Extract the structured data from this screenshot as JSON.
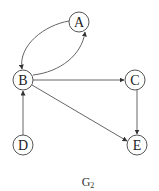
{
  "graph": {
    "caption": "G",
    "caption_subscript": "2",
    "nodes": [
      {
        "id": "A",
        "label": "A",
        "x": 79,
        "y": 22
      },
      {
        "id": "B",
        "label": "B",
        "x": 23,
        "y": 80
      },
      {
        "id": "C",
        "label": "C",
        "x": 135,
        "y": 80
      },
      {
        "id": "D",
        "label": "D",
        "x": 23,
        "y": 145
      },
      {
        "id": "E",
        "label": "E",
        "x": 137,
        "y": 145
      }
    ],
    "edges": [
      {
        "from": "A",
        "to": "B",
        "shape": "curved"
      },
      {
        "from": "B",
        "to": "A",
        "shape": "curved"
      },
      {
        "from": "B",
        "to": "C",
        "shape": "straight"
      },
      {
        "from": "B",
        "to": "E",
        "shape": "straight"
      },
      {
        "from": "C",
        "to": "E",
        "shape": "straight"
      },
      {
        "from": "D",
        "to": "B",
        "shape": "straight"
      }
    ],
    "directed": true
  }
}
